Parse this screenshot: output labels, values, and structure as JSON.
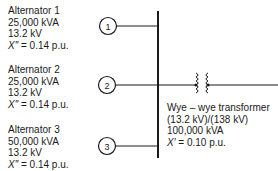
{
  "alternators": [
    {
      "node": "1",
      "name": "Alternator 1",
      "rating": "25,000 kVA",
      "voltage": "13.2 kV",
      "reactance_symbol": "X″",
      "reactance_value": " = 0.14 p.u."
    },
    {
      "node": "2",
      "name": "Alternator 2",
      "rating": "25,000 kVA",
      "voltage": "13.2 kV",
      "reactance_symbol": "X″",
      "reactance_value": " = 0.14 p.u."
    },
    {
      "node": "3",
      "name": "Alternator 3",
      "rating": "50,000 kVA",
      "voltage": "13.2 kV",
      "reactance_symbol": "X″",
      "reactance_value": " = 0.14 p.u."
    }
  ],
  "transformer": {
    "title": "Wye – wye transformer",
    "ratio": "(13.2 kV)/(138 kV)",
    "rating": "100,000 kVA",
    "reactance_symbol": "X′",
    "reactance_value": " = 0.10 p.u."
  },
  "colors": {
    "line": "#1a1a1a",
    "background": "#ffffff"
  }
}
